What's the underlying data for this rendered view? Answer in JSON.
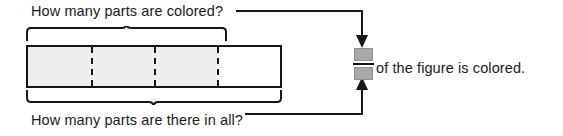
{
  "worksheet": {
    "width": 563,
    "height": 136,
    "background": "#ffffff",
    "ink_color": "#161616"
  },
  "labels": {
    "colored_question": "How many parts are colored?",
    "total_question": "How many parts are there in all?",
    "result_sentence": "of the figure is colored."
  },
  "figure": {
    "type": "partitioned-bar",
    "total_parts": 4,
    "shaded_parts": 3,
    "shaded_fill": "#eeeeee",
    "unshaded_fill": "#ffffff",
    "outline_color": "#161616",
    "divider_style": "dashed",
    "parts": [
      {
        "index": 1,
        "shaded": true
      },
      {
        "index": 2,
        "shaded": true
      },
      {
        "index": 3,
        "shaded": true
      },
      {
        "index": 4,
        "shaded": false
      }
    ]
  },
  "braces": {
    "top": {
      "spans_parts": 3,
      "points_to": "colored_question",
      "description": "brace over the three colored parts"
    },
    "bottom": {
      "spans_parts": 4,
      "points_to": "total_question",
      "description": "brace under all four parts"
    }
  },
  "fraction": {
    "numerator_value": "",
    "denominator_value": "",
    "numerator_placeholder_color": "#a8a8a8",
    "denominator_placeholder_color": "#a8a8a8",
    "bar_color": "#161616",
    "numerator_source": "colored_question",
    "denominator_source": "total_question"
  },
  "connectors": [
    {
      "name": "colored-to-numerator",
      "from": "colored_question",
      "to": "fraction_numerator",
      "arrow_direction": "down"
    },
    {
      "name": "total-to-denominator",
      "from": "total_question",
      "to": "fraction_denominator",
      "arrow_direction": "up"
    }
  ]
}
